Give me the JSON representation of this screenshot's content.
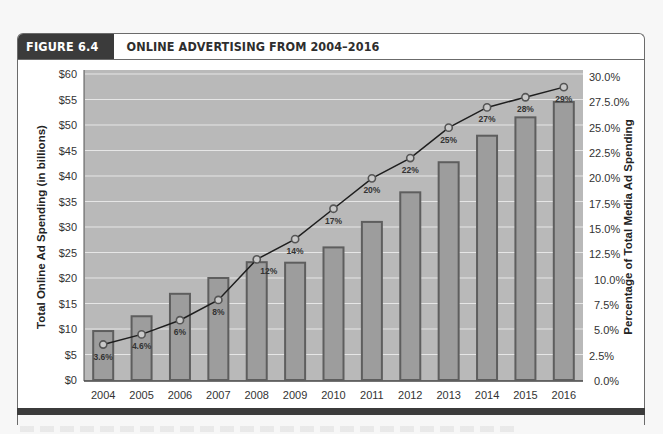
{
  "figure": {
    "label": "FIGURE 6.4",
    "title": "ONLINE ADVERTISING FROM 2004–2016"
  },
  "chart_data": {
    "type": "bar",
    "title": "ONLINE ADVERTISING FROM 2004–2016",
    "categories": [
      "2004",
      "2005",
      "2006",
      "2007",
      "2008",
      "2009",
      "2010",
      "2011",
      "2012",
      "2013",
      "2014",
      "2015",
      "2016"
    ],
    "series": [
      {
        "name": "Total Online Ad Spending (in billions)",
        "type": "bar",
        "axis": "left",
        "values": [
          9.6,
          12.5,
          16.9,
          20.0,
          23.1,
          23.0,
          26.0,
          31.0,
          36.8,
          42.7,
          47.9,
          51.5,
          54.5
        ]
      },
      {
        "name": "Percentage of Total Media Ad Spending",
        "type": "line",
        "axis": "right",
        "values": [
          3.6,
          4.6,
          6,
          8,
          12,
          14,
          17,
          20,
          22,
          25,
          27,
          28,
          29
        ],
        "labels": [
          "3.6%",
          "4.6%",
          "6%",
          "8%",
          "12%",
          "14%",
          "17%",
          "20%",
          "22%",
          "25%",
          "27%",
          "28%",
          "29%"
        ]
      }
    ],
    "xlabel": "",
    "ylabel": "Total Online Ad Spending (in billions)",
    "y2label": "Percentage of Total Media Ad Spending",
    "ylim": [
      0,
      60
    ],
    "y2lim": [
      0,
      30
    ],
    "yticks": [
      "$0",
      "$5",
      "$10",
      "$15",
      "$20",
      "$25",
      "$30",
      "$35",
      "$40",
      "$45",
      "$50",
      "$55",
      "$60"
    ],
    "y2ticks": [
      "0.0%",
      "2.5%",
      "5.0%",
      "7.5%",
      "10.0%",
      "12.5%",
      "15.0%",
      "17.5%",
      "20.0%",
      "22.5%",
      "25.0%",
      "27.5.0%",
      "30.0%"
    ],
    "grid": true,
    "legend": "none",
    "colors": {
      "plot_bg": "#b9b9b9",
      "bar_fill": "#9d9d9d",
      "bar_edge": "#5e5e5e",
      "line": "#1e1e1e",
      "marker_fill": "#c9c9c9",
      "gridline": "#e6e6e6"
    }
  }
}
